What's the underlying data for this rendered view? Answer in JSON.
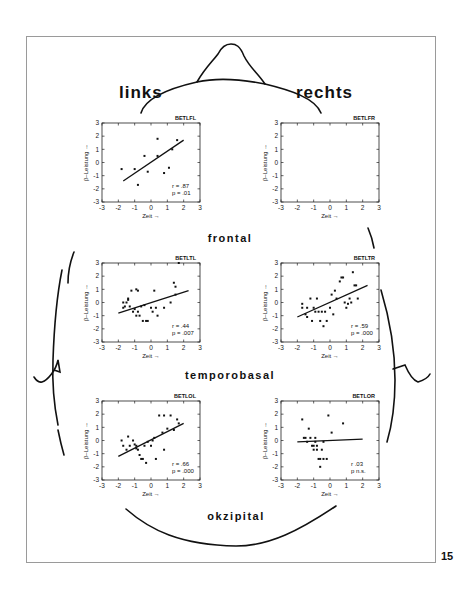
{
  "figure": {
    "side_labels": {
      "left": "links",
      "right": "rechts"
    },
    "region_labels": {
      "frontal": "frontal",
      "temporobasal": "temporobasal",
      "okzipital": "okzipital"
    },
    "page_number": "15",
    "axis": {
      "xlabel": "Zeit →",
      "ylabel": "β–Leistung →",
      "ticks": [
        "-3",
        "-2",
        "-1",
        "0",
        "1",
        "2",
        "3"
      ],
      "yticks": [
        "3",
        "2",
        "1",
        "0",
        "-1",
        "-2",
        "-3"
      ]
    }
  },
  "chart_data": [
    {
      "type": "scatter",
      "title": "BETLFL",
      "xlabel": "Zeit",
      "ylabel": "β-Leistung",
      "xlim": [
        -3,
        3
      ],
      "ylim": [
        -3,
        3
      ],
      "points": [
        [
          -1.8,
          -0.5
        ],
        [
          -1.0,
          -0.5
        ],
        [
          -0.8,
          -1.7
        ],
        [
          -0.4,
          0.5
        ],
        [
          -0.2,
          -0.7
        ],
        [
          0.4,
          1.8
        ],
        [
          0.4,
          0.5
        ],
        [
          0.8,
          -0.8
        ],
        [
          1.1,
          -0.4
        ],
        [
          1.3,
          1.0
        ],
        [
          1.6,
          1.7
        ]
      ],
      "fit_line": [
        [
          -1.7,
          -1.4
        ],
        [
          2.0,
          1.7
        ]
      ],
      "stats": {
        "r_label": "r =",
        "r": ".87",
        "p_label": "p =",
        "p": ".01"
      }
    },
    {
      "type": "scatter",
      "title": "BETLFR",
      "xlabel": "Zeit",
      "ylabel": "β-Leistung",
      "xlim": [
        -3,
        3
      ],
      "ylim": [
        -3,
        3
      ],
      "points": [],
      "fit_line": null,
      "stats": null
    },
    {
      "type": "scatter",
      "title": "BETLTL",
      "xlabel": "Zeit",
      "ylabel": "β-Leistung",
      "xlim": [
        -3,
        3
      ],
      "ylim": [
        -3,
        3
      ],
      "points": [
        [
          -1.7,
          0.0
        ],
        [
          -1.6,
          -0.3
        ],
        [
          -1.5,
          0.0
        ],
        [
          -1.7,
          -0.4
        ],
        [
          -1.4,
          0.3
        ],
        [
          -1.4,
          0.2
        ],
        [
          -1.3,
          -0.3
        ],
        [
          -1.2,
          0.9
        ],
        [
          -1.1,
          -0.7
        ],
        [
          -1.0,
          -0.5
        ],
        [
          -0.9,
          -1.0
        ],
        [
          -0.9,
          1.0
        ],
        [
          -0.8,
          0.9
        ],
        [
          -0.8,
          -0.7
        ],
        [
          -0.7,
          -1.0
        ],
        [
          -0.6,
          -0.3
        ],
        [
          -0.5,
          -1.4
        ],
        [
          -0.4,
          -0.2
        ],
        [
          -0.3,
          -1.4
        ],
        [
          -0.2,
          -1.4
        ],
        [
          0.0,
          -0.4
        ],
        [
          0.1,
          -0.7
        ],
        [
          0.2,
          0.9
        ],
        [
          0.3,
          -0.4
        ],
        [
          0.4,
          -1.0
        ],
        [
          0.8,
          -0.4
        ],
        [
          1.2,
          0.0
        ],
        [
          1.4,
          1.5
        ],
        [
          1.5,
          1.2
        ],
        [
          1.5,
          0.6
        ],
        [
          1.7,
          3.0
        ]
      ],
      "fit_line": [
        [
          -2.0,
          -0.8
        ],
        [
          2.3,
          0.9
        ]
      ],
      "stats": {
        "r_label": "r =",
        "r": ".44",
        "p_label": "p =",
        "p": ".007"
      }
    },
    {
      "type": "scatter",
      "title": "BETLTR",
      "xlabel": "Zeit",
      "ylabel": "β-Leistung",
      "xlim": [
        -3,
        3
      ],
      "ylim": [
        -3,
        3
      ],
      "points": [
        [
          -1.7,
          -0.1
        ],
        [
          -1.7,
          -0.4
        ],
        [
          -1.5,
          -0.9
        ],
        [
          -1.4,
          -0.4
        ],
        [
          -1.4,
          -1.1
        ],
        [
          -1.2,
          0.3
        ],
        [
          -1.1,
          -1.4
        ],
        [
          -1.0,
          -0.4
        ],
        [
          -0.9,
          -0.7
        ],
        [
          -0.8,
          0.3
        ],
        [
          -0.7,
          -0.7
        ],
        [
          -0.6,
          -1.4
        ],
        [
          -0.5,
          -0.7
        ],
        [
          -0.4,
          -1.8
        ],
        [
          -0.3,
          -0.7
        ],
        [
          -0.2,
          -1.4
        ],
        [
          0.0,
          -0.4
        ],
        [
          0.1,
          0.6
        ],
        [
          0.2,
          -0.9
        ],
        [
          0.3,
          0.9
        ],
        [
          0.4,
          0.3
        ],
        [
          0.6,
          1.6
        ],
        [
          0.7,
          1.9
        ],
        [
          0.8,
          1.9
        ],
        [
          0.9,
          0.0
        ],
        [
          1.0,
          -0.4
        ],
        [
          1.1,
          -0.1
        ],
        [
          1.2,
          0.3
        ],
        [
          1.3,
          0.0
        ],
        [
          1.4,
          2.3
        ],
        [
          1.5,
          1.3
        ],
        [
          1.6,
          1.3
        ],
        [
          1.7,
          0.3
        ]
      ],
      "fit_line": [
        [
          -2.0,
          -1.1
        ],
        [
          2.3,
          1.3
        ]
      ],
      "stats": {
        "r_label": "r =",
        "r": ".59",
        "p_label": "p =",
        "p": ".000"
      }
    },
    {
      "type": "scatter",
      "title": "BETLOL",
      "xlabel": "Zeit",
      "ylabel": "β-Leistung",
      "xlim": [
        -3,
        3
      ],
      "ylim": [
        -3,
        3
      ],
      "points": [
        [
          -1.8,
          0.0
        ],
        [
          -1.7,
          -0.4
        ],
        [
          -1.5,
          -0.7
        ],
        [
          -1.4,
          0.3
        ],
        [
          -1.3,
          -0.4
        ],
        [
          -1.1,
          0.0
        ],
        [
          -1.0,
          -0.3
        ],
        [
          -0.9,
          -0.6
        ],
        [
          -0.9,
          -0.4
        ],
        [
          -0.8,
          -0.7
        ],
        [
          -0.7,
          -1.1
        ],
        [
          -0.6,
          -1.4
        ],
        [
          -0.5,
          -1.4
        ],
        [
          -0.4,
          -0.4
        ],
        [
          -0.3,
          -1.7
        ],
        [
          -0.2,
          -0.1
        ],
        [
          0.0,
          -0.4
        ],
        [
          0.1,
          0.0
        ],
        [
          0.2,
          0.2
        ],
        [
          0.3,
          -1.4
        ],
        [
          0.5,
          1.9
        ],
        [
          0.7,
          0.6
        ],
        [
          0.8,
          1.9
        ],
        [
          0.8,
          -0.7
        ],
        [
          1.0,
          0.9
        ],
        [
          1.2,
          1.9
        ],
        [
          1.4,
          0.8
        ],
        [
          1.6,
          1.6
        ],
        [
          1.7,
          1.3
        ]
      ],
      "fit_line": [
        [
          -2.0,
          -1.2
        ],
        [
          2.0,
          1.3
        ]
      ],
      "stats": {
        "r_label": "r =",
        "r": ".66",
        "p_label": "p =",
        "p": ".000"
      }
    },
    {
      "type": "scatter",
      "title": "BETLOR",
      "xlabel": "Zeit",
      "ylabel": "β-Leistung",
      "xlim": [
        -3,
        3
      ],
      "ylim": [
        -3,
        3
      ],
      "points": [
        [
          -1.7,
          1.6
        ],
        [
          -1.6,
          0.2
        ],
        [
          -1.5,
          0.2
        ],
        [
          -1.4,
          -0.1
        ],
        [
          -1.3,
          0.9
        ],
        [
          -1.2,
          0.2
        ],
        [
          -1.1,
          -0.4
        ],
        [
          -1.0,
          -0.4
        ],
        [
          -1.0,
          -0.7
        ],
        [
          -0.9,
          0.2
        ],
        [
          -0.9,
          -0.1
        ],
        [
          -0.8,
          -0.4
        ],
        [
          -0.8,
          -0.7
        ],
        [
          -0.7,
          -1.4
        ],
        [
          -0.6,
          -1.4
        ],
        [
          -0.6,
          -2.0
        ],
        [
          -0.5,
          -0.7
        ],
        [
          -0.4,
          -1.4
        ],
        [
          -0.4,
          -0.1
        ],
        [
          -0.2,
          -1.4
        ],
        [
          -0.1,
          1.9
        ],
        [
          0.1,
          0.6
        ],
        [
          0.8,
          1.3
        ]
      ],
      "fit_line": [
        [
          -2.0,
          -0.1
        ],
        [
          2.0,
          0.1
        ]
      ],
      "stats": {
        "r_label": "r",
        "r": ".03",
        "p_label": "p",
        "p": "n.s."
      }
    }
  ]
}
